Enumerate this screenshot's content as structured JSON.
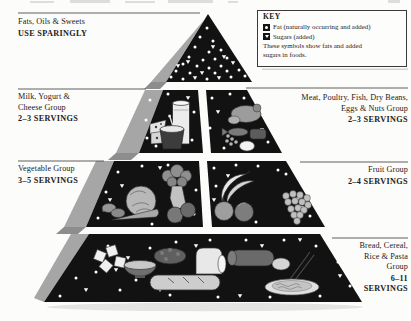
{
  "labels": {
    "fats": {
      "group_line1": "Fats, Oils & Sweets",
      "advice": "USE SPARINGLY"
    },
    "milk": {
      "group_line1": "Milk, Yogurt &",
      "group_line2": "Cheese Group",
      "servings": "2–3 SERVINGS"
    },
    "vegetable": {
      "group_line1": "Vegetable Group",
      "servings": "3–5 SERVINGS"
    },
    "meat": {
      "group_line1": "Meat, Poultry, Fish, Dry Beans,",
      "group_line2": "Eggs & Nuts Group",
      "servings": "2–3 SERVINGS"
    },
    "fruit": {
      "group_line1": "Fruit Group",
      "servings": "2–4 SERVINGS"
    },
    "bread": {
      "group_line1": "Bread, Cereal,",
      "group_line2": "Rice & Pasta",
      "group_line3": "Group",
      "servings_line1": "6–11",
      "servings_line2": "SERVINGS"
    }
  },
  "key": {
    "title": "KEY",
    "fat_label": "Fat (naturally occurring and added)",
    "sugars_label": "Sugars (added)",
    "note_line1": "These symbols show fats and added",
    "note_line2": "sugars in foods."
  },
  "colors": {
    "tier_fill": "#121212",
    "side_face": "#a6a6a6",
    "side_face_dark": "#8d8d8d",
    "rule": "#4f4f4f",
    "dot": "#ffffff",
    "text": "#1b1b1b"
  }
}
